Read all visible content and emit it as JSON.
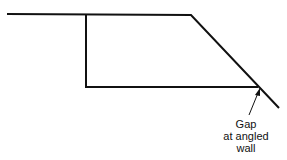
{
  "diagram": {
    "annotation": {
      "line1": "Gap",
      "line2": "at angled",
      "line3": "wall"
    },
    "colors": {
      "stroke": "#111111",
      "background": "#ffffff"
    }
  }
}
